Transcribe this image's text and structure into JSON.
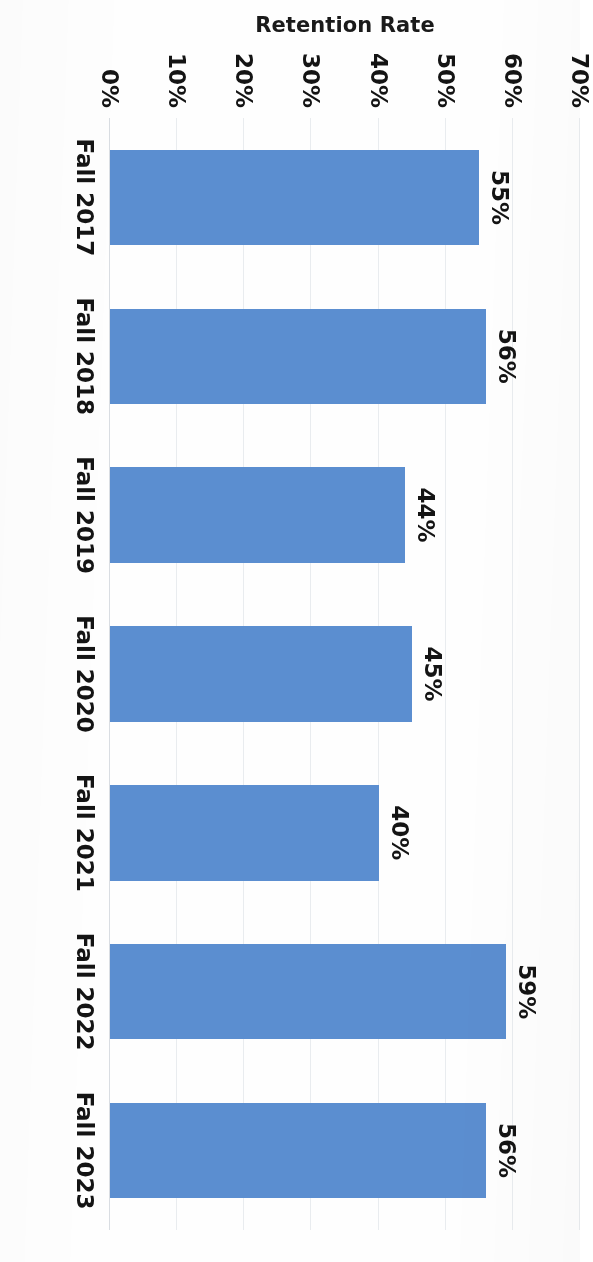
{
  "chart_data": {
    "type": "bar",
    "orientation": "vertical-columns-rendered-sideways",
    "title": "",
    "xlabel": "",
    "ylabel": "Retention Rate",
    "categories": [
      "Fall 2017",
      "Fall 2018",
      "Fall 2019",
      "Fall 2020",
      "Fall 2021",
      "Fall 2022",
      "Fall 2023"
    ],
    "values": [
      55,
      56,
      44,
      45,
      40,
      59,
      56
    ],
    "data_labels": [
      "55%",
      "56%",
      "44%",
      "45%",
      "40%",
      "59%",
      "56%"
    ],
    "ylim": [
      0,
      70
    ],
    "yticks": [
      0,
      10,
      20,
      30,
      40,
      50,
      60,
      70
    ],
    "ytick_labels": [
      "0%",
      "10%",
      "20%",
      "30%",
      "40%",
      "50%",
      "60%",
      "70%"
    ],
    "grid": true,
    "legend": false,
    "series": [
      {
        "name": "Retention Rate",
        "color": "#5b8ed0",
        "values": [
          55,
          56,
          44,
          45,
          40,
          59,
          56
        ]
      }
    ]
  },
  "axis": {
    "value_axis_title": "Retention Rate"
  },
  "colors": {
    "bar": "#5b8ed0",
    "grid": "#e9ecef",
    "baseline": "#d9dde2",
    "text": "#141414",
    "background": "#fefefe"
  }
}
